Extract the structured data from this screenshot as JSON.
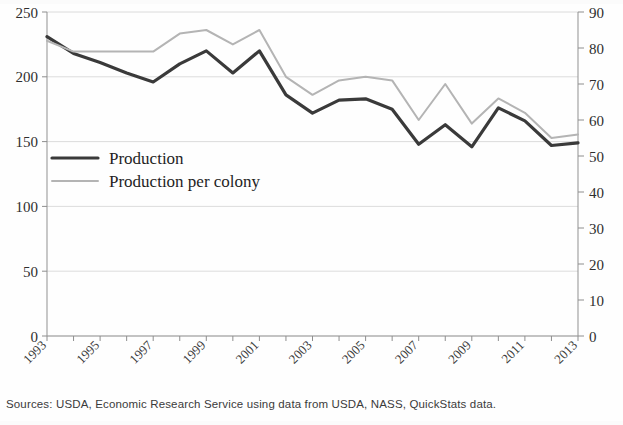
{
  "figure": {
    "source_note": "Sources: USDA, Economic Research Service using data from USDA, NASS, QuickStats data.",
    "background_color": "#fefefe",
    "frame_color": "#c8c8c8"
  },
  "legend": {
    "position": "inside-left-middle",
    "entries": [
      {
        "label": "Production",
        "color": "#3a3a3a",
        "width": 3.2
      },
      {
        "label": "Production per colony",
        "color": "#b4b4b4",
        "width": 2.0
      }
    ]
  },
  "axes": {
    "left": {
      "label": "",
      "min": 0,
      "max": 250,
      "ticks": [
        0,
        50,
        100,
        150,
        200,
        250
      ],
      "tick_labels": [
        "0",
        "50",
        "100",
        "150",
        "200",
        "250"
      ]
    },
    "right": {
      "label": "",
      "min": 0,
      "max": 90,
      "ticks": [
        0,
        10,
        20,
        30,
        40,
        50,
        60,
        70,
        80,
        90
      ],
      "tick_labels": [
        "0",
        "10",
        "20",
        "30",
        "40",
        "50",
        "60",
        "70",
        "80",
        "90"
      ]
    },
    "x": {
      "label": "",
      "min": 1993,
      "max": 2013,
      "ticks": [
        1993,
        1994,
        1995,
        1996,
        1997,
        1998,
        1999,
        2000,
        2001,
        2002,
        2003,
        2004,
        2005,
        2006,
        2007,
        2008,
        2009,
        2010,
        2011,
        2012,
        2013
      ],
      "tick_labels": [
        "1993",
        "",
        "1995",
        "",
        "1997",
        "",
        "1999",
        "",
        "2001",
        "",
        "2003",
        "",
        "2005",
        "",
        "2007",
        "",
        "2009",
        "",
        "2011",
        "",
        "2013"
      ],
      "label_rotation": -45
    }
  },
  "chart_data": {
    "type": "line",
    "title": "",
    "subtitle": "",
    "xlabel": "",
    "ylabel": "",
    "ylim": [
      0,
      250
    ],
    "y2lim": [
      0,
      90
    ],
    "xlim": [
      1993,
      2013
    ],
    "grid": true,
    "grid_axis": "y-left",
    "legend_position": "inside-left-middle",
    "x": [
      1993,
      1994,
      1995,
      1996,
      1997,
      1998,
      1999,
      2000,
      2001,
      2002,
      2003,
      2004,
      2005,
      2006,
      2007,
      2008,
      2009,
      2010,
      2011,
      2012,
      2013
    ],
    "series": [
      {
        "name": "Production",
        "axis": "left",
        "color": "#3a3a3a",
        "values": [
          231,
          218,
          211,
          203,
          196,
          210,
          220,
          203,
          220,
          186,
          172,
          182,
          183,
          175,
          148,
          163,
          146,
          176,
          166,
          147,
          149
        ]
      },
      {
        "name": "Production per colony",
        "axis": "right",
        "color": "#b4b4b4",
        "values": [
          82,
          79,
          79,
          79,
          79,
          84,
          85,
          81,
          85,
          72,
          67,
          71,
          72,
          71,
          60,
          70,
          59,
          66,
          62,
          55,
          56
        ]
      }
    ],
    "annotations": []
  }
}
